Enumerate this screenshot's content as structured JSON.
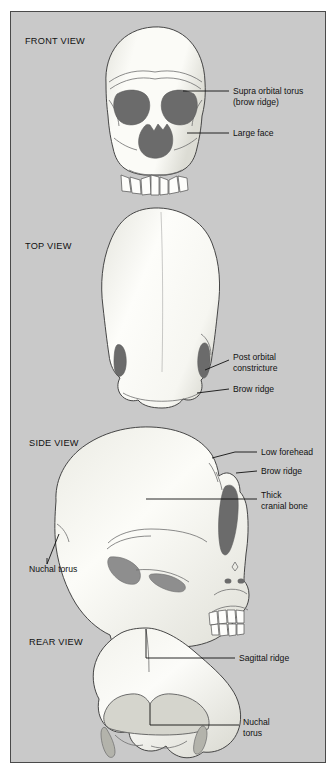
{
  "figure": {
    "panel_background_color": "#c9c9c9",
    "panel_border_color": "#4a4a4a",
    "bone_light_color": "#fbfbf7",
    "bone_shadow_color": "#d8d8d2",
    "cavity_color": "#6b6b6b",
    "outline_color": "#3d3d3d",
    "text_color": "#111111"
  },
  "views": [
    {
      "id": "front",
      "title": "FRONT VIEW",
      "labels": [
        {
          "id": "supra-orbital-torus",
          "line1": "Supra orbital torus",
          "line2": "(brow ridge)"
        },
        {
          "id": "large-face",
          "line1": "Large face",
          "line2": ""
        }
      ]
    },
    {
      "id": "top",
      "title": "TOP VIEW",
      "labels": [
        {
          "id": "post-orbital-constricture",
          "line1": "Post orbital",
          "line2": "constricture"
        },
        {
          "id": "brow-ridge",
          "line1": "Brow ridge",
          "line2": ""
        }
      ]
    },
    {
      "id": "side",
      "title": "SIDE VIEW",
      "labels": [
        {
          "id": "low-forehead",
          "line1": "Low forehead",
          "line2": ""
        },
        {
          "id": "brow-ridge",
          "line1": "Brow ridge",
          "line2": ""
        },
        {
          "id": "thick-cranial-bone",
          "line1": "Thick",
          "line2": "cranial bone"
        },
        {
          "id": "nuchal-torus",
          "line1": "Nuchal torus",
          "line2": ""
        }
      ]
    },
    {
      "id": "rear",
      "title": "REAR VIEW",
      "labels": [
        {
          "id": "sagittal-ridge",
          "line1": "Sagittal ridge",
          "line2": ""
        },
        {
          "id": "nuchal-torus",
          "line1": "Nuchal",
          "line2": "torus"
        }
      ]
    }
  ]
}
